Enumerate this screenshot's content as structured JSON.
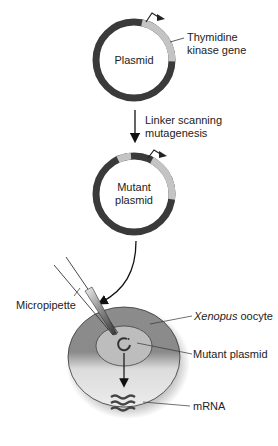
{
  "plasmid": {
    "label": "Plasmid",
    "gene_label_line1": "Thymidine",
    "gene_label_line2": "kinase gene"
  },
  "step": {
    "label_line1": "Linker scanning",
    "label_line2": "mutagenesis"
  },
  "mutant_plasmid": {
    "label_line1": "Mutant",
    "label_line2": "plasmid"
  },
  "injection": {
    "micropipette_label": "Micropipette",
    "oocyte_label_italic": "Xenopus",
    "oocyte_label_rest": " oocyte",
    "mutant_plasmid_label": "Mutant plasmid",
    "mrna_label": "mRNA"
  },
  "colors": {
    "backbone": "#3a3a3a",
    "gene": "#c4c4c4",
    "oocyte_dark": "#8a8a8a",
    "oocyte_light": "#e2e2e2",
    "nucleus": "#bdbdbd"
  }
}
